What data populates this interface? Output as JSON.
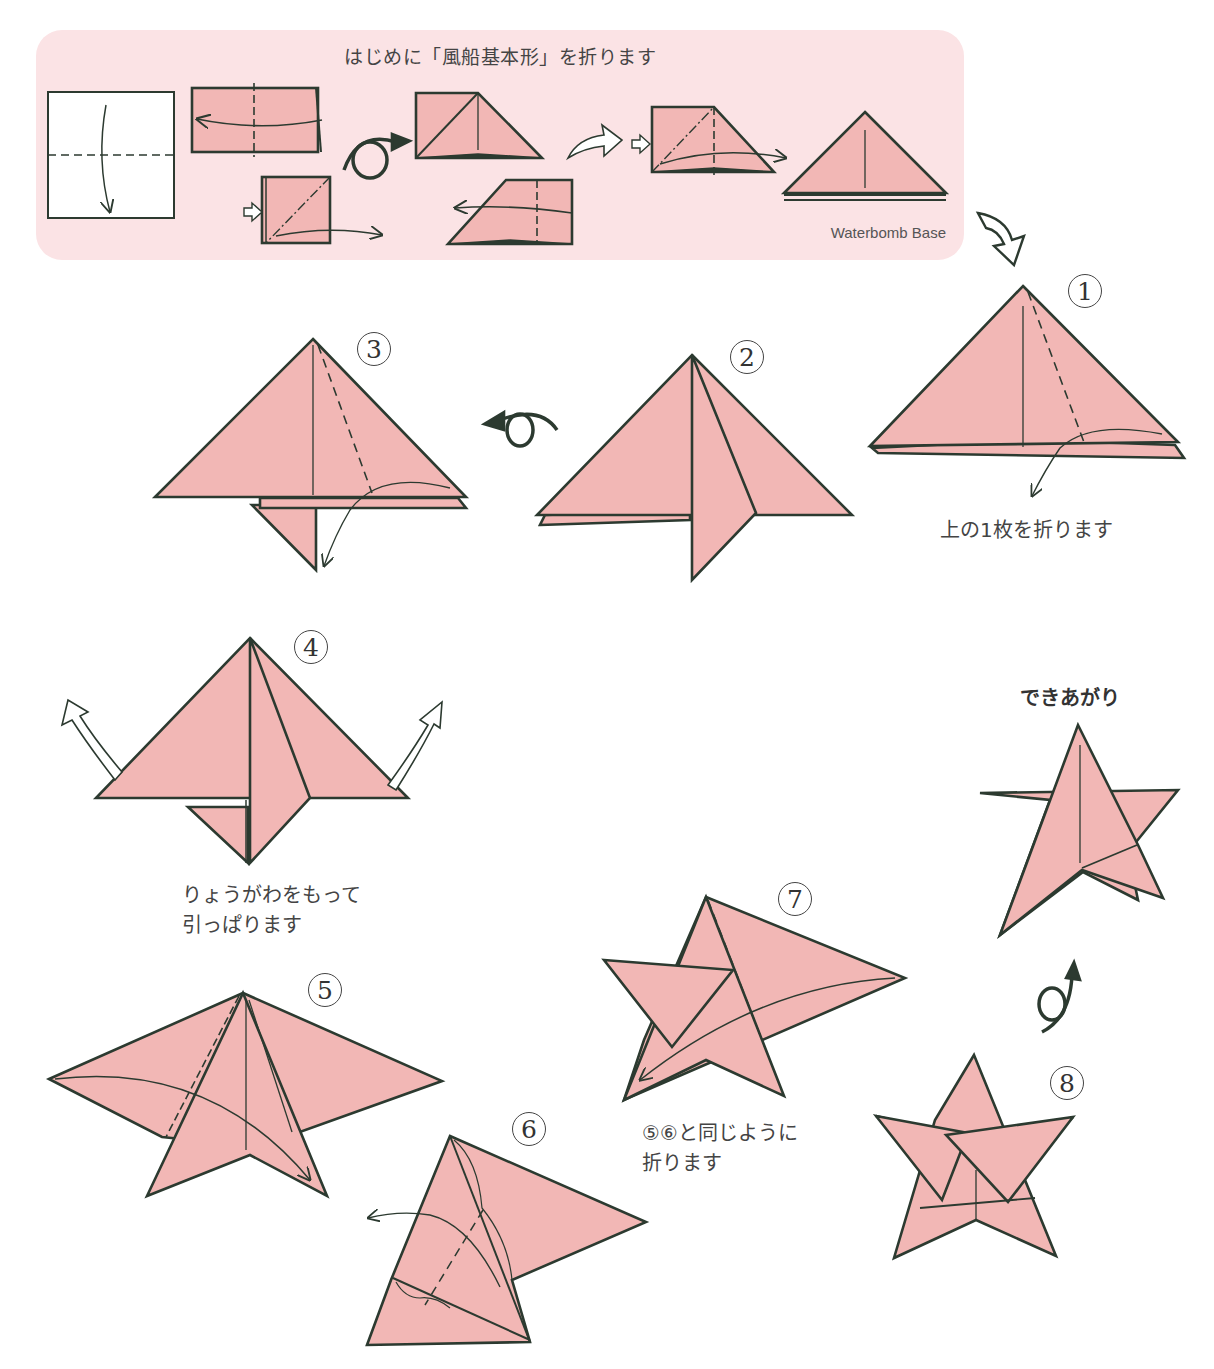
{
  "intro": {
    "title": "はじめに「風船基本形」を折ります",
    "base_label": "Waterbomb Base"
  },
  "steps": [
    {
      "num": "1",
      "caption": "上の1枚を折ります"
    },
    {
      "num": "2",
      "caption": ""
    },
    {
      "num": "3",
      "caption": ""
    },
    {
      "num": "4",
      "caption": "りょうがわをもって\n引っぱります"
    },
    {
      "num": "5",
      "caption": ""
    },
    {
      "num": "6",
      "caption": ""
    },
    {
      "num": "7",
      "caption": "⑤⑥と同じように\n折ります"
    },
    {
      "num": "8",
      "caption": ""
    }
  ],
  "final": {
    "label": "できあがり"
  },
  "icons": {
    "turn_over": "turn-over-icon",
    "next_arrow": "hollow-arrow-icon",
    "push_in": "push-arrow-icon",
    "rotate": "rotate-icon"
  },
  "colors": {
    "paper": "#f2b7b5",
    "intro_bg": "#fbe3e5",
    "line": "#2c3a30",
    "text": "#444444"
  }
}
